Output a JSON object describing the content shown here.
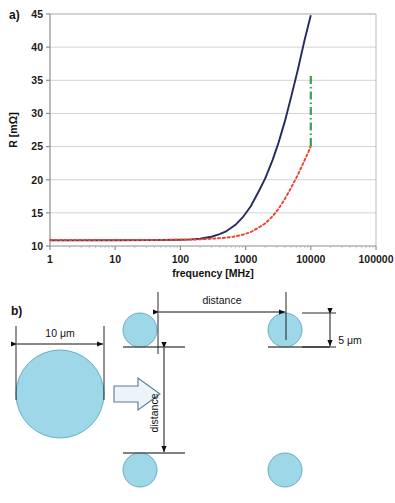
{
  "figure": {
    "panel_a_tag": "a)",
    "panel_b_tag": "b)"
  },
  "chart_data": {
    "type": "line",
    "title": "",
    "xlabel": "frequency [MHz]",
    "ylabel": "R [mΩ]",
    "xscale": "log",
    "yscale": "linear",
    "xlim": [
      1,
      100000
    ],
    "ylim": [
      10,
      45
    ],
    "xticks": [
      "1",
      "10",
      "100",
      "1000",
      "10000",
      "100000"
    ],
    "xtick_values": [
      1,
      10,
      100,
      1000,
      10000,
      100000
    ],
    "yticks": [
      "10",
      "15",
      "20",
      "25",
      "30",
      "35",
      "40",
      "45"
    ],
    "ytick_values": [
      10,
      15,
      20,
      25,
      30,
      35,
      40,
      45
    ],
    "grid": "horizontal",
    "legend_position": "none",
    "series": [
      {
        "name": "solid-navy-curve",
        "style": "solid",
        "color": "#262b5e",
        "x": [
          1,
          3,
          10,
          30,
          100,
          150,
          200,
          300,
          400,
          500,
          700,
          900,
          1200,
          1600,
          2000,
          2600,
          3200,
          4000,
          5000,
          6300,
          8000,
          10000
        ],
        "y": [
          10.85,
          10.85,
          10.86,
          10.88,
          10.95,
          11.0,
          11.1,
          11.4,
          11.8,
          12.2,
          13.2,
          14.3,
          16.0,
          18.3,
          20.2,
          23.0,
          25.6,
          28.8,
          32.5,
          36.5,
          41.0,
          44.8
        ]
      },
      {
        "name": "dotted-red-curve",
        "style": "dotted",
        "color": "#e8442a",
        "x": [
          1,
          3,
          10,
          30,
          100,
          200,
          300,
          500,
          700,
          900,
          1200,
          1600,
          2000,
          2600,
          3200,
          4000,
          5000,
          6300,
          8000,
          9200,
          10000
        ],
        "y": [
          10.9,
          10.9,
          10.9,
          10.9,
          10.95,
          11.0,
          11.1,
          11.25,
          11.45,
          11.7,
          12.1,
          12.8,
          13.4,
          14.5,
          15.6,
          17.1,
          18.8,
          20.7,
          22.9,
          24.2,
          25.1
        ]
      },
      {
        "name": "green-dashdot-vertical-marker",
        "style": "dash-dot",
        "color": "#3a9e52",
        "x": [
          10000,
          10000
        ],
        "y": [
          25.1,
          36.1
        ]
      }
    ]
  },
  "diagram": {
    "big_circle_label": "10 μm",
    "small_circle_label": "5 μm",
    "horizontal_distance_label": "distance",
    "vertical_distance_label": "distance",
    "circle_fill": "#9ed8e8",
    "circle_stroke": "#5aa8bf",
    "arrow_fill": "#eaf4fa",
    "arrow_stroke": "#5a7a8a",
    "line_color": "#555555"
  }
}
